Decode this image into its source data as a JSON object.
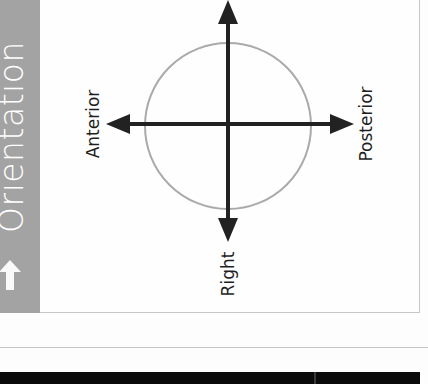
{
  "sidebar": {
    "title": "Orientation",
    "icon": "arrow-up-icon",
    "background": "#a3a3a3",
    "text_color": "#ffffff"
  },
  "diagram": {
    "labels": {
      "left": "Anterior",
      "right": "Posterior",
      "bottom": "Right"
    },
    "axis_color": "#222222",
    "circle_color": "#aaaaaa",
    "center": [
      228,
      124
    ],
    "circle_radius": 83,
    "arrows": [
      "up",
      "down",
      "left",
      "right"
    ]
  }
}
